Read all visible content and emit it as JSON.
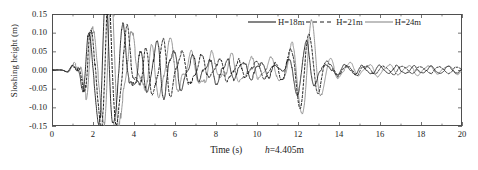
{
  "figure": {
    "background": "#ffffff",
    "frame_color": "#4f4f4f"
  },
  "axis": {
    "y_title": "Sloshing height (m)",
    "x_title": "Time (s)",
    "x_annotation_prefix": "h",
    "x_annotation": "=4.405m",
    "y_ticks": [
      "0.15",
      "0.10",
      "0.05",
      "0.00",
      "-0.05",
      "-0.10",
      "-0.15"
    ],
    "x_ticks": [
      "0",
      "2",
      "4",
      "6",
      "8",
      "10",
      "12",
      "14",
      "16",
      "18",
      "20"
    ]
  },
  "legend": {
    "items": [
      {
        "label": "H=18m",
        "style": "solid-dark",
        "color": "#1f1f1f"
      },
      {
        "label": "H=21m",
        "style": "dashed-dark",
        "color": "#1f1f1f"
      },
      {
        "label": "H=24m",
        "style": "solid-gray",
        "color": "#8a8a8a"
      }
    ]
  },
  "chart_data": {
    "type": "line",
    "title": "",
    "subtitle": "",
    "xlabel": "Time (s)",
    "ylabel": "Sloshing height (m)",
    "xlim": [
      0,
      20
    ],
    "ylim": [
      -0.15,
      0.15
    ],
    "xticks": [
      0,
      2,
      4,
      6,
      8,
      10,
      12,
      14,
      16,
      18,
      20
    ],
    "yticks": [
      -0.15,
      -0.1,
      -0.05,
      0.0,
      0.05,
      0.1,
      0.15
    ],
    "grid": false,
    "legend_position": "top-right",
    "annotations": [
      {
        "text": "h=4.405m",
        "location": "below-x-axis"
      }
    ],
    "series": [
      {
        "name": "H=18m",
        "color": "#1f1f1f",
        "linestyle": "solid",
        "linewidth": 0.9,
        "params": {
          "f1": 1.21,
          "f2": 2.33,
          "f3": 0.55,
          "amp": 0.052,
          "decay": 0.195,
          "phase": 0.0,
          "burst1_t": 2.45,
          "burst1_a": 0.105,
          "burst2_t": 12.3,
          "burst2_a": 0.078,
          "noise_seed": 17
        }
      },
      {
        "name": "H=21m",
        "color": "#1f1f1f",
        "linestyle": "dashed",
        "linewidth": 1.0,
        "params": {
          "f1": 1.13,
          "f2": 2.19,
          "f3": 0.51,
          "amp": 0.056,
          "decay": 0.21,
          "phase": 0.22,
          "burst1_t": 2.58,
          "burst1_a": 0.112,
          "burst2_t": 12.45,
          "burst2_a": 0.082,
          "noise_seed": 43
        }
      },
      {
        "name": "H=24m",
        "color": "#8a8a8a",
        "linestyle": "solid",
        "linewidth": 0.9,
        "params": {
          "f1": 1.05,
          "f2": 2.05,
          "f3": 0.47,
          "amp": 0.062,
          "decay": 0.165,
          "phase": 0.45,
          "burst1_t": 2.7,
          "burst1_a": 0.128,
          "burst2_t": 12.6,
          "burst2_a": 0.096,
          "noise_seed": 71
        }
      }
    ],
    "peaks": {
      "H=18m": {
        "max": 0.105,
        "min": -0.104,
        "max_t": 2.45,
        "min_t": 2.6
      },
      "H=21m": {
        "max": 0.109,
        "min": -0.112,
        "max_t": 2.5,
        "min_t": 2.68
      },
      "H=24m": {
        "max": 0.112,
        "min": -0.128,
        "max_t": 2.58,
        "min_t": 2.75
      }
    }
  },
  "geometry": {
    "plot_left": 52,
    "plot_right": 462,
    "plot_top": 14,
    "plot_bottom": 126
  }
}
